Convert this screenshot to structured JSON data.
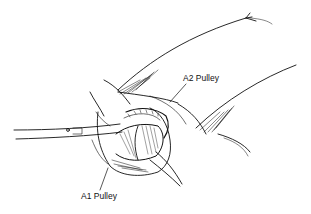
{
  "figure": {
    "labels": [
      {
        "id": "a2",
        "text": "A2 Pulley"
      },
      {
        "id": "a1",
        "text": "A1 Pulley"
      }
    ],
    "colors": {
      "ink": "#111111",
      "background": "#ffffff"
    }
  }
}
